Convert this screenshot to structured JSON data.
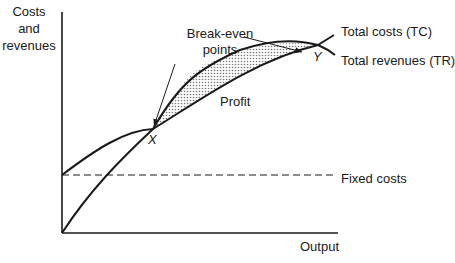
{
  "diagram": {
    "type": "break-even chart",
    "y_axis_label": [
      "Costs",
      "and",
      "revenues"
    ],
    "x_axis_label": "Output",
    "curves": {
      "total_costs": {
        "label": "Total costs (TC)"
      },
      "total_revenues": {
        "label": "Total revenues (TR)"
      },
      "fixed_costs": {
        "label": "Fixed costs",
        "style": "dashed"
      }
    },
    "annotations": {
      "break_even_label": [
        "Break-even",
        "points"
      ],
      "region_label": "Profit",
      "point_x": "X",
      "point_y": "Y"
    },
    "colors": {
      "line": "#1a1a1a",
      "fill_pattern": "#b8b8b8",
      "background": "#ffffff"
    }
  }
}
